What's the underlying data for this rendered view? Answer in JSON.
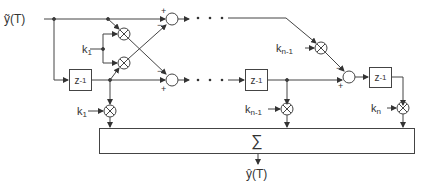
{
  "diagram": {
    "type": "lattice filter block diagram",
    "input_label": "ỹ(T)",
    "output_label": "ŷ(T)",
    "summer_symbol": "∑",
    "delay_label": "z",
    "delay_exponent": "-1",
    "coefficients": {
      "k1_lattice": {
        "base": "k",
        "sub": "1"
      },
      "kn1_lattice": {
        "base": "k",
        "sub": "n-1"
      },
      "k1_tap": {
        "base": "k",
        "sub": "1"
      },
      "kn1_tap": {
        "base": "k",
        "sub": "n-1"
      },
      "kn_tap": {
        "base": "k",
        "sub": "n"
      }
    },
    "signs": {
      "adder1_top_plus": "+",
      "adder1_top_minus": "−",
      "adder1_bottom_minus": "−",
      "adder1_bottom_plus": "+",
      "adder2_minus": "−",
      "adder2_plus": "+"
    },
    "ellipsis": "• • •",
    "colors": {
      "line": "#444444",
      "background": "#ffffff"
    }
  }
}
